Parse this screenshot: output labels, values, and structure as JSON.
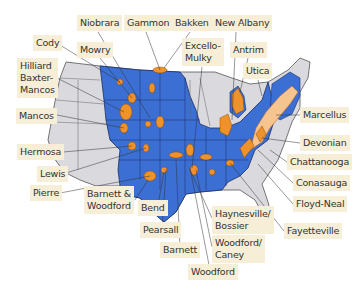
{
  "colors": {
    "shale_state": "#3b6fd4",
    "other_state": "#d9d9de",
    "play": "#f0922a",
    "marcellus_light": "#f6c48e",
    "label_bg": "#f6eed6"
  },
  "labels": [
    {
      "id": "niobrara",
      "text": "Niobrara",
      "x": 77,
      "y": 15
    },
    {
      "id": "gammon",
      "text": "Gammon",
      "x": 124,
      "y": 15
    },
    {
      "id": "bakken",
      "text": "Bakken",
      "x": 172,
      "y": 15
    },
    {
      "id": "new-albany",
      "text": "New Albany",
      "x": 212,
      "y": 15
    },
    {
      "id": "cody",
      "text": "Cody",
      "x": 33,
      "y": 35
    },
    {
      "id": "mowry",
      "text": "Mowry",
      "x": 77,
      "y": 42
    },
    {
      "id": "excello-mulky",
      "text": "Excello-\nMulky",
      "x": 182,
      "y": 38
    },
    {
      "id": "antrim",
      "text": "Antrim",
      "x": 230,
      "y": 42
    },
    {
      "id": "utica",
      "text": "Utica",
      "x": 243,
      "y": 63
    },
    {
      "id": "hilliard",
      "text": "Hilliard\nBaxter-\nMancos",
      "x": 17,
      "y": 58
    },
    {
      "id": "mancos",
      "text": "Mancos",
      "x": 16,
      "y": 108
    },
    {
      "id": "marcellus",
      "text": "Marcellus",
      "x": 300,
      "y": 107
    },
    {
      "id": "devonian",
      "text": "Devonian",
      "x": 300,
      "y": 135
    },
    {
      "id": "hermosa",
      "text": "Hermosa",
      "x": 17,
      "y": 144
    },
    {
      "id": "chattanooga",
      "text": "Chattanooga",
      "x": 287,
      "y": 154
    },
    {
      "id": "lewis",
      "text": "Lewis",
      "x": 37,
      "y": 166
    },
    {
      "id": "conasauga",
      "text": "Conasauga",
      "x": 293,
      "y": 175
    },
    {
      "id": "pierre",
      "text": "Pierre",
      "x": 30,
      "y": 185
    },
    {
      "id": "barnett-woodford",
      "text": "Barnett &\nWoodford",
      "x": 84,
      "y": 186
    },
    {
      "id": "floyd-neal",
      "text": "Floyd-Neal",
      "x": 293,
      "y": 196
    },
    {
      "id": "bend",
      "text": "Bend",
      "x": 138,
      "y": 200
    },
    {
      "id": "haynesville",
      "text": "Haynesville/\nBossier",
      "x": 212,
      "y": 206
    },
    {
      "id": "pearsall",
      "text": "Pearsall",
      "x": 140,
      "y": 222
    },
    {
      "id": "fayetteville",
      "text": "Fayetteville",
      "x": 284,
      "y": 223
    },
    {
      "id": "woodford-caney",
      "text": "Woodford/\nCaney",
      "x": 212,
      "y": 235
    },
    {
      "id": "barnett",
      "text": "Barnett",
      "x": 160,
      "y": 242
    },
    {
      "id": "woodford",
      "text": "Woodford",
      "x": 188,
      "y": 264
    }
  ]
}
